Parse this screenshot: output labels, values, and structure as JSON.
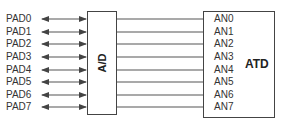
{
  "diagram": {
    "ad_block": {
      "label": "A/D"
    },
    "atd_block": {
      "label": "ATD"
    },
    "pads": [
      {
        "label": "PAD0",
        "y": 19
      },
      {
        "label": "PAD1",
        "y": 32
      },
      {
        "label": "PAD2",
        "y": 44
      },
      {
        "label": "PAD3",
        "y": 57
      },
      {
        "label": "PAD4",
        "y": 70
      },
      {
        "label": "PAD5",
        "y": 82
      },
      {
        "label": "PAD6",
        "y": 95
      },
      {
        "label": "PAD7",
        "y": 107
      }
    ],
    "channels": [
      {
        "label": "AN0"
      },
      {
        "label": "AN1"
      },
      {
        "label": "AN2"
      },
      {
        "label": "AN3"
      },
      {
        "label": "AN4"
      },
      {
        "label": "AN5"
      },
      {
        "label": "AN6"
      },
      {
        "label": "AN7"
      }
    ],
    "colors": {
      "line": "#555555",
      "box": "#444444",
      "text": "#333333"
    }
  }
}
